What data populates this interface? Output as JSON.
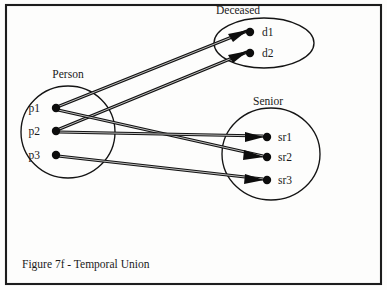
{
  "figure": {
    "caption": "Figure 7f - Temporal Union",
    "width": 387,
    "height": 290,
    "border_color": "#1c1c1c",
    "background_color": "#fdfdfc",
    "ink_color": "#0d0d0d"
  },
  "sets": [
    {
      "id": "person",
      "label": "Person",
      "shape": "circle",
      "cx": 68,
      "cy": 132,
      "rx": 47,
      "ry": 46,
      "label_x": 68,
      "label_y": 78
    },
    {
      "id": "deceased",
      "label": "Deceased",
      "shape": "ellipse",
      "cx": 264,
      "cy": 43,
      "rx": 50,
      "ry": 25,
      "label_x": 216,
      "label_y": 14
    },
    {
      "id": "senior",
      "label": "Senior",
      "shape": "circle",
      "cx": 271,
      "cy": 154,
      "rx": 49,
      "ry": 46,
      "label_x": 268,
      "label_y": 105
    }
  ],
  "nodes": [
    {
      "id": "p1",
      "label": "p1",
      "set": "person",
      "x": 56,
      "y": 108,
      "label_x": 40,
      "label_y": 112
    },
    {
      "id": "p2",
      "label": "p2",
      "set": "person",
      "x": 56,
      "y": 131,
      "label_x": 40,
      "label_y": 135
    },
    {
      "id": "p3",
      "label": "p3",
      "set": "person",
      "x": 56,
      "y": 155,
      "label_x": 40,
      "label_y": 159
    },
    {
      "id": "d1",
      "label": "d1",
      "set": "deceased",
      "x": 250,
      "y": 32,
      "label_x": 262,
      "label_y": 36
    },
    {
      "id": "d2",
      "label": "d2",
      "set": "deceased",
      "x": 250,
      "y": 53,
      "label_x": 262,
      "label_y": 57
    },
    {
      "id": "sr1",
      "label": "sr1",
      "set": "senior",
      "x": 267,
      "y": 137,
      "label_x": 278,
      "label_y": 141
    },
    {
      "id": "sr2",
      "label": "sr2",
      "set": "senior",
      "x": 267,
      "y": 157,
      "label_x": 278,
      "label_y": 161
    },
    {
      "id": "sr3",
      "label": "sr3",
      "set": "senior",
      "x": 267,
      "y": 180,
      "label_x": 278,
      "label_y": 184
    }
  ],
  "edges": [
    {
      "id": "p1-d1",
      "from": "p1",
      "to": "d1",
      "x1": 57,
      "y1": 107,
      "x2": 247,
      "y2": 31
    },
    {
      "id": "p2-d2",
      "from": "p2",
      "to": "d2",
      "x1": 57,
      "y1": 130,
      "x2": 247,
      "y2": 52
    },
    {
      "id": "p1-sr2",
      "from": "p1",
      "to": "sr2",
      "x1": 58,
      "y1": 110,
      "x2": 263,
      "y2": 156
    },
    {
      "id": "p2-sr1",
      "from": "p2",
      "to": "sr1",
      "x1": 58,
      "y1": 132,
      "x2": 263,
      "y2": 136
    },
    {
      "id": "p3-sr3",
      "from": "p3",
      "to": "sr3",
      "x1": 58,
      "y1": 156,
      "x2": 263,
      "y2": 179
    }
  ],
  "node_radius": 4.2,
  "dot_radius_small": 3.8
}
